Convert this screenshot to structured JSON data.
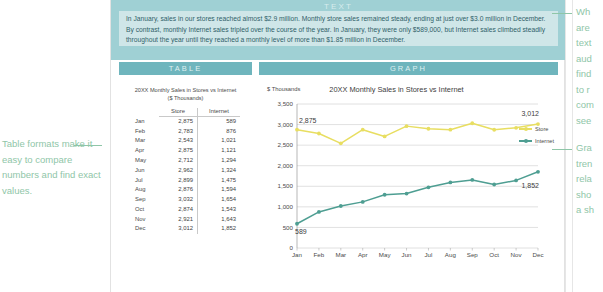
{
  "sections": {
    "text_label": "TEXT",
    "table_label": "TABLE",
    "graph_label": "GRAPH"
  },
  "text_panel": {
    "paragraph": "In January, sales in our stores reached almost $2.9 million. Monthly store sales remained steady, ending at just over $3.0 million in December. By contrast, monthly Internet sales tripled over the course of the year. In January, they were only $589,000, but Internet sales climbed steadily throughout the year until they reached a monthly level of more than $1.85 million in December."
  },
  "table_panel": {
    "title_line1": "20XX Monthly Sales in Stores vs Internet",
    "title_line2": "($ Thousands)",
    "columns": [
      "",
      "Store",
      "Internet"
    ],
    "rows": [
      {
        "month": "Jan",
        "store": "2,875",
        "internet": "589"
      },
      {
        "month": "Feb",
        "store": "2,783",
        "internet": "876"
      },
      {
        "month": "Mar",
        "store": "2,543",
        "internet": "1,021"
      },
      {
        "month": "Apr",
        "store": "2,875",
        "internet": "1,121"
      },
      {
        "month": "May",
        "store": "2,712",
        "internet": "1,294"
      },
      {
        "month": "Jun",
        "store": "2,962",
        "internet": "1,324"
      },
      {
        "month": "Jul",
        "store": "2,899",
        "internet": "1,475"
      },
      {
        "month": "Aug",
        "store": "2,876",
        "internet": "1,594"
      },
      {
        "month": "Sep",
        "store": "3,032",
        "internet": "1,654"
      },
      {
        "month": "Oct",
        "store": "2,874",
        "internet": "1,543"
      },
      {
        "month": "Nov",
        "store": "2,921",
        "internet": "1,643"
      },
      {
        "month": "Dec",
        "store": "3,012",
        "internet": "1,852"
      }
    ]
  },
  "graph_panel": {
    "units_label": "$ Thousands",
    "legend": [
      {
        "name": "Store",
        "color": "#e8de61"
      },
      {
        "name": "Internet",
        "color": "#4e9e92"
      }
    ],
    "callouts": {
      "store_first": "2,875",
      "store_last": "3,012",
      "internet_first": "589",
      "internet_last": "1,852"
    }
  },
  "annotations": {
    "left": "Table formats make it easy to compare numbers and find exact values.",
    "top_right": "Wh\nare\ntext\naud\nfind\nto r\ncom\nsee",
    "bottom_right": "Gra\ntren\nrela\nsho\na sh"
  },
  "chart_data": {
    "type": "line",
    "title": "20XX Monthly Sales in Stores vs Internet",
    "xlabel": "",
    "ylabel": "$ Thousands",
    "categories": [
      "Jan",
      "Feb",
      "Mar",
      "Apr",
      "May",
      "Jun",
      "Jul",
      "Aug",
      "Sep",
      "Oct",
      "Nov",
      "Dec"
    ],
    "series": [
      {
        "name": "Store",
        "color": "#e8de61",
        "values": [
          2875,
          2783,
          2543,
          2875,
          2712,
          2962,
          2899,
          2876,
          3032,
          2874,
          2921,
          3012
        ]
      },
      {
        "name": "Internet",
        "color": "#4e9e92",
        "values": [
          589,
          876,
          1021,
          1121,
          1294,
          1324,
          1475,
          1594,
          1654,
          1543,
          1643,
          1852
        ]
      }
    ],
    "ylim": [
      0,
      3500
    ],
    "yticks": [
      0,
      500,
      1000,
      1500,
      2000,
      2500,
      3000,
      3500
    ],
    "ytick_labels": [
      "0",
      "500",
      "1,000",
      "1,500",
      "2,000",
      "2,500",
      "3,000",
      "3,500"
    ],
    "grid": true,
    "legend_position": "right",
    "annotations": [
      {
        "text": "2,875",
        "series": "Store",
        "x": "Jan"
      },
      {
        "text": "3,012",
        "series": "Store",
        "x": "Dec"
      },
      {
        "text": "589",
        "series": "Internet",
        "x": "Jan"
      },
      {
        "text": "1,852",
        "series": "Internet",
        "x": "Dec"
      }
    ]
  }
}
